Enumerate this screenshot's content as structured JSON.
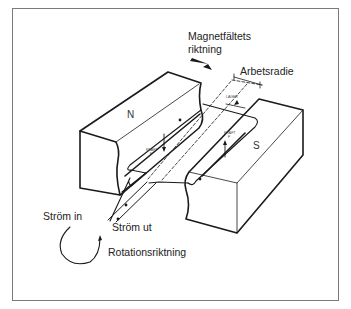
{
  "diagram": {
    "labels": {
      "field_direction_line1": "Magnetfältets",
      "field_direction_line2": "riktning",
      "working_radius": "Arbetsradie",
      "bearing": "LAGER",
      "force_left": "KRAFT",
      "force_left_sym": "F",
      "force_right": "KRAFT",
      "force_right_sym": "F",
      "pole_north": "N",
      "pole_south": "S",
      "current_in": "Ström in",
      "current_out": "Ström ut",
      "rotation_direction": "Rotationsriktning"
    },
    "colors": {
      "line": "#1a1a1a",
      "frame": "#7a7a7a",
      "background": "#ffffff"
    }
  }
}
